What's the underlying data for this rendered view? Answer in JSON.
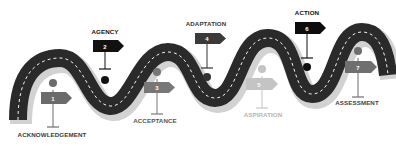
{
  "diagram": {
    "type": "roadmap",
    "road_color": "#2b2b2b",
    "shadow_color": "#cfcfcf",
    "dash_color": "#ffffff",
    "steps": [
      {
        "number": "1",
        "label": "ACKNOWLEDGEMENT",
        "color": "#6b6b6b",
        "label_color": "#3a3a3a",
        "position": "below"
      },
      {
        "number": "2",
        "label": "AGENCY",
        "color": "#111111",
        "label_color": "#111111",
        "position": "above"
      },
      {
        "number": "3",
        "label": "ACCEPTANCE",
        "color": "#777777",
        "label_color": "#555555",
        "position": "below"
      },
      {
        "number": "4",
        "label": "ADAPTATION",
        "color": "#3a3a3a",
        "label_color": "#3a3a3a",
        "position": "above"
      },
      {
        "number": "5",
        "label": "ASPIRATION",
        "color": "#c4c4c4",
        "label_color": "#b5b5b5",
        "position": "below"
      },
      {
        "number": "6",
        "label": "ACTION",
        "color": "#0d0d0d",
        "label_color": "#111111",
        "position": "above"
      },
      {
        "number": "7",
        "label": "ASSESSMENT",
        "color": "#6f6f6f",
        "label_color": "#444444",
        "position": "below"
      }
    ]
  }
}
